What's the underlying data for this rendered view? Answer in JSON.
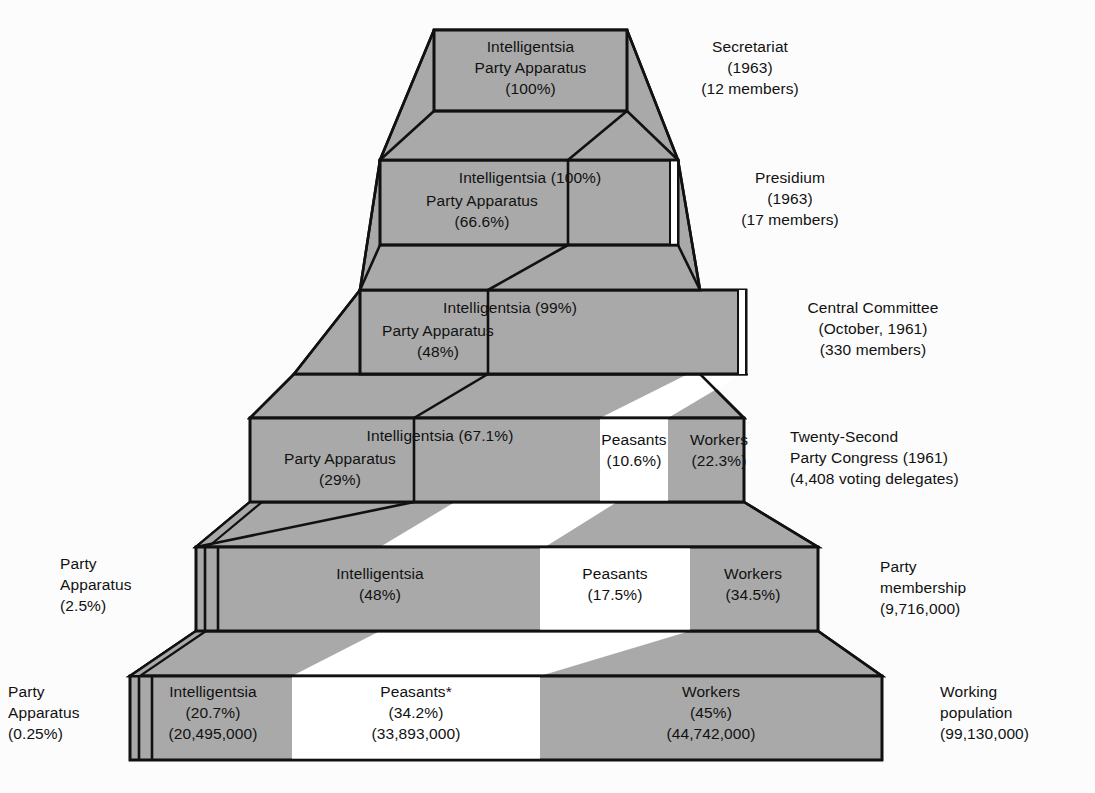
{
  "figure": {
    "type": "stepped-pyramid-diagram",
    "background_color": "#fcfcfc",
    "fill_gray": "#a9a9a9",
    "fill_white": "#ffffff",
    "stroke_color": "#111111",
    "footnote_marker": "*"
  },
  "tiers": [
    {
      "id": "secretariat",
      "right_label": [
        "Secretariat",
        "(1963)",
        "(12 members)"
      ],
      "blocks": [
        {
          "name": "intelligentsia-party-apparatus",
          "lines": [
            "Intelligentsia",
            "Party Apparatus",
            "(100%)"
          ]
        }
      ],
      "segments": [
        {
          "group": "Intelligentsia",
          "percent": "100%",
          "fill": "gray"
        }
      ]
    },
    {
      "id": "presidium",
      "right_label": [
        "Presidium",
        "(1963)",
        "(17 members)"
      ],
      "blocks": [
        {
          "name": "intelligentsia",
          "lines": [
            "Intelligentsia (100%)"
          ]
        },
        {
          "name": "party-apparatus",
          "lines": [
            "Party Apparatus",
            "(66.6%)"
          ]
        }
      ],
      "segments": [
        {
          "group": "Intelligentsia",
          "percent": "100%",
          "fill": "gray"
        }
      ]
    },
    {
      "id": "central-committee",
      "right_label": [
        "Central Committee",
        "(October, 1961)",
        "(330 members)"
      ],
      "blocks": [
        {
          "name": "intelligentsia",
          "lines": [
            "Intelligentsia (99%)"
          ]
        },
        {
          "name": "party-apparatus",
          "lines": [
            "Party Apparatus",
            "(48%)"
          ]
        }
      ],
      "segments": [
        {
          "group": "Intelligentsia",
          "percent": "99%",
          "fill": "gray"
        }
      ]
    },
    {
      "id": "twenty-second-party-congress",
      "right_label": [
        "Twenty-Second",
        "Party Congress (1961)",
        "(4,408 voting delegates)"
      ],
      "blocks": [
        {
          "name": "intelligentsia",
          "lines": [
            "Intelligentsia (67.1%)"
          ]
        },
        {
          "name": "party-apparatus",
          "lines": [
            "Party Apparatus",
            "(29%)"
          ]
        },
        {
          "name": "peasants",
          "lines": [
            "Peasants",
            "(10.6%)"
          ]
        },
        {
          "name": "workers",
          "lines": [
            "Workers",
            "(22.3%)"
          ]
        }
      ],
      "segments": [
        {
          "group": "Intelligentsia",
          "percent": "67.1%",
          "fill": "gray"
        },
        {
          "group": "Peasants",
          "percent": "10.6%",
          "fill": "white"
        },
        {
          "group": "Workers",
          "percent": "22.3%",
          "fill": "gray"
        }
      ]
    },
    {
      "id": "party-membership",
      "right_label": [
        "Party",
        "membership",
        "(9,716,000)"
      ],
      "left_label": [
        "Party",
        "Apparatus",
        "(2.5%)"
      ],
      "blocks": [
        {
          "name": "intelligentsia",
          "lines": [
            "Intelligentsia",
            "(48%)"
          ]
        },
        {
          "name": "peasants",
          "lines": [
            "Peasants",
            "(17.5%)"
          ]
        },
        {
          "name": "workers",
          "lines": [
            "Workers",
            "(34.5%)"
          ]
        }
      ],
      "segments": [
        {
          "group": "Intelligentsia",
          "percent": "48%",
          "fill": "gray"
        },
        {
          "group": "Peasants",
          "percent": "17.5%",
          "fill": "white"
        },
        {
          "group": "Workers",
          "percent": "34.5%",
          "fill": "gray"
        }
      ]
    },
    {
      "id": "working-population",
      "right_label": [
        "Working",
        "population",
        "(99,130,000)"
      ],
      "left_label": [
        "Party",
        "Apparatus",
        "(0.25%)"
      ],
      "blocks": [
        {
          "name": "intelligentsia",
          "lines": [
            "Intelligentsia",
            "(20.7%)",
            "(20,495,000)"
          ]
        },
        {
          "name": "peasants",
          "lines": [
            "Peasants*",
            "(34.2%)",
            "(33,893,000)"
          ]
        },
        {
          "name": "workers",
          "lines": [
            "Workers",
            "(45%)",
            "(44,742,000)"
          ]
        }
      ],
      "segments": [
        {
          "group": "Intelligentsia",
          "percent": "20.7%",
          "count": "20,495,000",
          "fill": "gray"
        },
        {
          "group": "Peasants",
          "percent": "34.2%",
          "count": "33,893,000",
          "fill": "white"
        },
        {
          "group": "Workers",
          "percent": "45%",
          "count": "44,742,000",
          "fill": "gray"
        }
      ]
    }
  ],
  "labels": {
    "t1_right": "Secretariat\n(1963)\n(12 members)",
    "t1_b1": "Intelligentsia\nParty Apparatus\n(100%)",
    "t2_right": "Presidium\n(1963)\n(17 members)",
    "t2_intel": "Intelligentsia (100%)",
    "t2_party": "Party Apparatus\n(66.6%)",
    "t3_right": "Central Committee\n(October, 1961)\n(330 members)",
    "t3_intel": "Intelligentsia (99%)",
    "t3_party": "Party Apparatus\n(48%)",
    "t4_right": "Twenty-Second\nParty Congress (1961)\n(4,408 voting delegates)",
    "t4_intel": "Intelligentsia (67.1%)",
    "t4_party": "Party Apparatus\n(29%)",
    "t4_peas": "Peasants\n(10.6%)",
    "t4_work": "Workers\n(22.3%)",
    "t5_right": "Party\nmembership\n(9,716,000)",
    "t5_left": "Party\nApparatus\n(2.5%)",
    "t5_intel": "Intelligentsia\n(48%)",
    "t5_peas": "Peasants\n(17.5%)",
    "t5_work": "Workers\n(34.5%)",
    "t6_right": "Working\npopulation\n(99,130,000)",
    "t6_left": "Party\nApparatus\n(0.25%)",
    "t6_intel": "Intelligentsia\n(20.7%)\n(20,495,000)",
    "t6_peas": "Peasants*\n(34.2%)\n(33,893,000)",
    "t6_work": "Workers\n(45%)\n(44,742,000)"
  }
}
